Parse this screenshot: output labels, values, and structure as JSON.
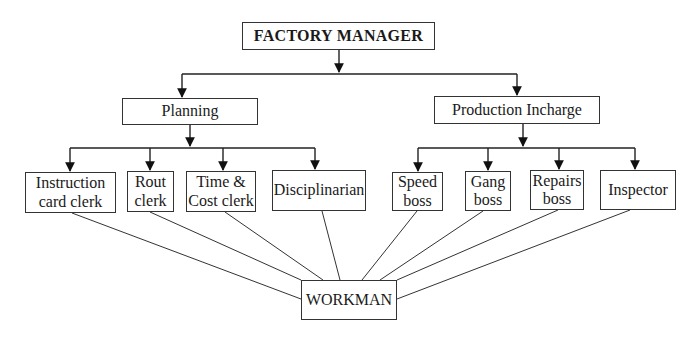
{
  "diagram": {
    "type": "org-chart",
    "root": {
      "id": "manager",
      "label": "FACTORY MANAGER"
    },
    "level2": [
      {
        "id": "planning",
        "label": "Planning"
      },
      {
        "id": "production",
        "label": "Production Incharge"
      }
    ],
    "planning_children": [
      {
        "id": "instruction",
        "label": "Instruction\ncard clerk"
      },
      {
        "id": "rout",
        "label": "Rout\nclerk"
      },
      {
        "id": "timecost",
        "label": "Time &\nCost clerk"
      },
      {
        "id": "disciplinarian",
        "label": "Disciplinarian"
      }
    ],
    "production_children": [
      {
        "id": "speed",
        "label": "Speed\nboss"
      },
      {
        "id": "gang",
        "label": "Gang\nboss"
      },
      {
        "id": "repairs",
        "label": "Repairs\nboss"
      },
      {
        "id": "inspector",
        "label": "Inspector"
      }
    ],
    "sink": {
      "id": "workman",
      "label": "WORKMAN"
    },
    "edges": [
      [
        "manager",
        "planning"
      ],
      [
        "manager",
        "production"
      ],
      [
        "planning",
        "instruction"
      ],
      [
        "planning",
        "rout"
      ],
      [
        "planning",
        "timecost"
      ],
      [
        "planning",
        "disciplinarian"
      ],
      [
        "production",
        "speed"
      ],
      [
        "production",
        "gang"
      ],
      [
        "production",
        "repairs"
      ],
      [
        "production",
        "inspector"
      ],
      [
        "instruction",
        "workman"
      ],
      [
        "rout",
        "workman"
      ],
      [
        "timecost",
        "workman"
      ],
      [
        "disciplinarian",
        "workman"
      ],
      [
        "speed",
        "workman"
      ],
      [
        "gang",
        "workman"
      ],
      [
        "repairs",
        "workman"
      ],
      [
        "inspector",
        "workman"
      ]
    ]
  }
}
